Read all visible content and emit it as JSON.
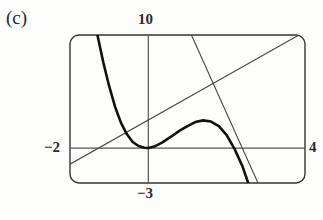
{
  "figure": {
    "part_label": "(c)",
    "kind": "graphing-calculator-viewing-window"
  },
  "labels": {
    "top": "10",
    "left": "−2",
    "right": "4",
    "bottom": "−3"
  },
  "colors": {
    "curve": "#111111",
    "tangent": "#444444",
    "axis": "#555555",
    "frame": "#333333",
    "background": "#fdfdfc",
    "text": "#2b2b2b"
  },
  "chart_data": {
    "type": "line",
    "title": "(c)",
    "xlabel": "",
    "ylabel": "",
    "xlim": [
      -2,
      4
    ],
    "ylim": [
      -3,
      10
    ],
    "grid": false,
    "legend": "none",
    "axis_tick_labels": {
      "xmin": "−2",
      "xmax": "4",
      "ymin": "−3",
      "ymax": "10"
    },
    "annotations": [
      {
        "text": "(c)",
        "position": "outside-top-left"
      },
      {
        "text": "10",
        "position": "above-window-top"
      },
      {
        "text": "−2",
        "position": "left-of-window"
      },
      {
        "text": "4",
        "position": "right-of-window"
      },
      {
        "text": "−3",
        "position": "below-window-bottom"
      }
    ],
    "series": [
      {
        "name": "cubic-curve",
        "role": "function",
        "style": "thick",
        "points": [
          [
            -1.3,
            10.0
          ],
          [
            -1.15,
            7.6
          ],
          [
            -1.0,
            5.5
          ],
          [
            -0.85,
            3.7
          ],
          [
            -0.7,
            2.3
          ],
          [
            -0.55,
            1.3
          ],
          [
            -0.4,
            0.6
          ],
          [
            -0.25,
            0.25
          ],
          [
            -0.1,
            0.1
          ],
          [
            0.0,
            0.08
          ],
          [
            0.15,
            0.2
          ],
          [
            0.35,
            0.55
          ],
          [
            0.55,
            1.0
          ],
          [
            0.8,
            1.6
          ],
          [
            1.0,
            2.0
          ],
          [
            1.2,
            2.35
          ],
          [
            1.4,
            2.5
          ],
          [
            1.6,
            2.4
          ],
          [
            1.8,
            2.0
          ],
          [
            2.0,
            1.2
          ],
          [
            2.2,
            0.0
          ],
          [
            2.4,
            -1.5
          ],
          [
            2.55,
            -3.0
          ]
        ]
      },
      {
        "name": "tangent-line-ascending",
        "role": "tangent",
        "style": "thin",
        "points": [
          [
            -2.0,
            -1.35
          ],
          [
            4.0,
            10.3
          ]
        ]
      },
      {
        "name": "tangent-line-descending",
        "role": "tangent",
        "style": "thin",
        "points": [
          [
            1.1,
            10.0
          ],
          [
            2.8,
            -3.0
          ]
        ]
      }
    ]
  }
}
